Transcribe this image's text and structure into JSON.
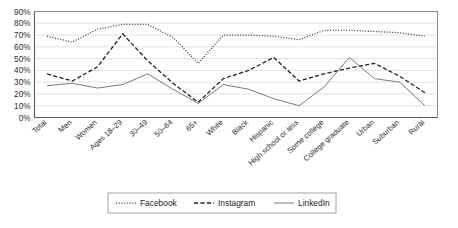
{
  "chart_data": {
    "type": "line",
    "title": "",
    "xlabel": "",
    "ylabel": "",
    "ylim": [
      0,
      90
    ],
    "ytick_step": 10,
    "grid": true,
    "legend_position": "bottom",
    "ytick_labels": [
      "90%",
      "80%",
      "70%",
      "60%",
      "50%",
      "40%",
      "30%",
      "20%",
      "10%",
      "0%"
    ],
    "categories": [
      "Total",
      "Men",
      "Women",
      "Ages 18–29",
      "30–49",
      "50–64",
      "65+",
      "White",
      "Black",
      "Hispanic",
      "High school or less",
      "Some college",
      "College graduate",
      "Urban",
      "Suburban",
      "Rural"
    ],
    "series": [
      {
        "name": "Facebook",
        "style": "dotted",
        "color": "#333333",
        "values": [
          69,
          64,
          75,
          79,
          79,
          68,
          46,
          70,
          70,
          69,
          66,
          74,
          74,
          73,
          72,
          69
        ]
      },
      {
        "name": "Instagram",
        "style": "dashed",
        "color": "#222222",
        "values": [
          37,
          31,
          43,
          71,
          48,
          29,
          13,
          33,
          40,
          51,
          31,
          37,
          42,
          46,
          35,
          21
        ]
      },
      {
        "name": "LinkedIn",
        "style": "solid",
        "color": "#7a7a7a",
        "values": [
          27,
          29,
          25,
          28,
          37,
          24,
          12,
          28,
          24,
          16,
          10,
          26,
          51,
          33,
          30,
          10
        ]
      }
    ]
  },
  "legend": {
    "items": [
      {
        "label": "Facebook",
        "style": "dotted"
      },
      {
        "label": "Instagram",
        "style": "dashed"
      },
      {
        "label": "LinkedIn",
        "style": "solid"
      }
    ]
  }
}
